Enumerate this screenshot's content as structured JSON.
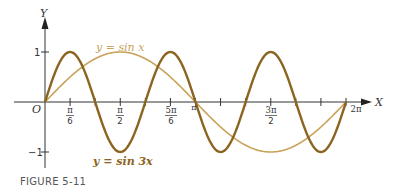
{
  "chart_data": {
    "type": "line",
    "title": "",
    "xlabel": "X",
    "ylabel": "Y",
    "origin_label": "O",
    "xlim": [
      0,
      6.2832
    ],
    "ylim": [
      -1,
      1
    ],
    "grid": false,
    "legend": "inline labels",
    "x_ticks": [
      {
        "value": 0.5236,
        "label_num": "π",
        "label_den": "6"
      },
      {
        "value": 1.0472,
        "label_num": "",
        "label_den": ""
      },
      {
        "value": 1.5708,
        "label_num": "π",
        "label_den": "2"
      },
      {
        "value": 2.0944,
        "label_num": "",
        "label_den": ""
      },
      {
        "value": 2.618,
        "label_num": "5π",
        "label_den": "6"
      },
      {
        "value": 3.1416,
        "label": "π"
      },
      {
        "value": 3.6652,
        "label_num": "",
        "label_den": ""
      },
      {
        "value": 4.1888,
        "label_num": "",
        "label_den": ""
      },
      {
        "value": 4.7124,
        "label_num": "3π",
        "label_den": "2"
      },
      {
        "value": 5.236,
        "label_num": "",
        "label_den": ""
      },
      {
        "value": 5.7596,
        "label_num": "",
        "label_den": ""
      },
      {
        "value": 6.2832,
        "label": "2π"
      }
    ],
    "y_ticks": [
      {
        "value": 1,
        "label": "1"
      },
      {
        "value": -1,
        "label": "−1"
      }
    ],
    "series": [
      {
        "name": "y = sin x",
        "function": "sin(x)",
        "color": "#C9A35A",
        "x": [
          0,
          0.5236,
          1.0472,
          1.5708,
          2.0944,
          2.618,
          3.1416,
          3.6652,
          4.1888,
          4.7124,
          5.236,
          5.7596,
          6.2832
        ],
        "y": [
          0,
          0.5,
          0.866,
          1,
          0.866,
          0.5,
          0,
          -0.5,
          -0.866,
          -1,
          -0.866,
          -0.5,
          0
        ]
      },
      {
        "name": "y = sin 3x",
        "function": "sin(3x)",
        "color": "#8B6420",
        "x": [
          0,
          0.5236,
          1.0472,
          1.5708,
          2.0944,
          2.618,
          3.1416,
          3.6652,
          4.1888,
          4.7124,
          5.236,
          5.7596,
          6.2832
        ],
        "y": [
          0,
          1,
          0,
          -1,
          0,
          1,
          0,
          -1,
          0,
          1,
          0,
          -1,
          0
        ]
      }
    ],
    "annotations": [
      {
        "text": "y = sin x",
        "series": 0
      },
      {
        "text": "y = sin 3x",
        "series": 1
      }
    ]
  },
  "labels": {
    "y_axis": "Y",
    "x_axis": "X",
    "origin": "O",
    "y_tick_pos": "1",
    "y_tick_neg": "−1",
    "tick_pi6_num": "π",
    "tick_pi6_den": "6",
    "tick_pi2_num": "π",
    "tick_pi2_den": "2",
    "tick_5pi6_num": "5π",
    "tick_5pi6_den": "6",
    "tick_pi": "π",
    "tick_3pi2_num": "3π",
    "tick_3pi2_den": "2",
    "tick_2pi": "2π",
    "sinx_label": "y = sin x",
    "sin3x_label": "y = sin 3x"
  },
  "caption": "FIGURE 5-11",
  "colors": {
    "axis": "#333333",
    "sin_x": "#C9A35A",
    "sin_3x": "#8B6420"
  }
}
